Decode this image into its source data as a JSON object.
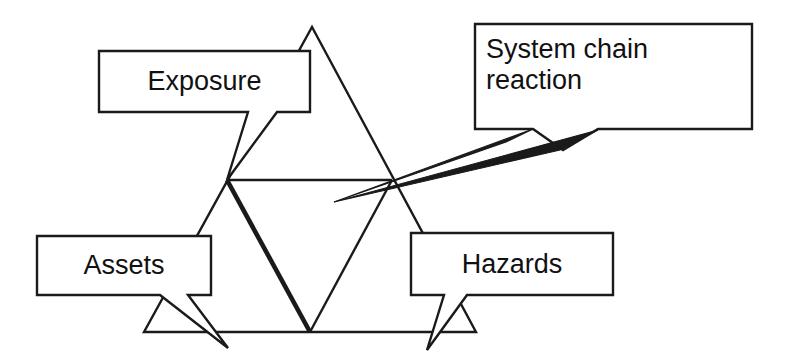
{
  "diagram": {
    "canvas": {
      "width": 790,
      "height": 354
    },
    "colors": {
      "stroke": "#1a1a1a",
      "fill": "#ffffff",
      "text": "#111111",
      "background": "#ffffff"
    },
    "nodes": [
      {
        "id": "exposure",
        "label": "Exposure",
        "box": {
          "x": 99,
          "y": 51,
          "width": 211,
          "height": 61
        },
        "callout_tail": "bottom, pointing down-left to triangle left midpoint"
      },
      {
        "id": "assets",
        "label": "Assets",
        "box": {
          "x": 37,
          "y": 236,
          "width": 174,
          "height": 59
        },
        "callout_tail": "bottom, pointing down-right to triangle lower-left area"
      },
      {
        "id": "hazards",
        "label": "Hazards",
        "box": {
          "x": 411,
          "y": 233,
          "width": 202,
          "height": 62
        },
        "callout_tail": "bottom, pointing down-left to triangle lower-right area"
      },
      {
        "id": "system-chain-reaction",
        "label": "System chain\nreaction",
        "box": {
          "x": 475,
          "y": 24,
          "width": 277,
          "height": 105
        },
        "callout_tail": "bottom-left, long pointer to centre of inner inverted triangle"
      }
    ],
    "triangle": {
      "description": "Large outer triangle with inscribed medial (inverted) triangle",
      "apex": {
        "x": 312,
        "y": 27
      },
      "bottom_left": {
        "x": 144,
        "y": 332
      },
      "bottom_right": {
        "x": 476,
        "y": 332
      },
      "left_midpoint": {
        "x": 227,
        "y": 180
      },
      "right_midpoint": {
        "x": 392,
        "y": 180
      },
      "bottom_midpoint": {
        "x": 310,
        "y": 332
      },
      "bold_edge": "left_midpoint -> bottom_midpoint"
    }
  }
}
